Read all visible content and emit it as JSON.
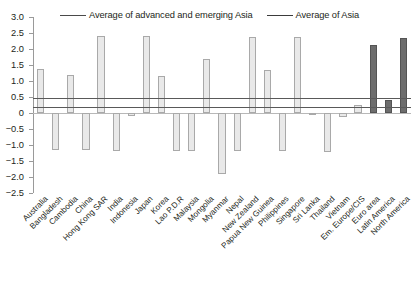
{
  "chart_data": {
    "type": "bar",
    "title": "",
    "xlabel": "",
    "ylabel": "",
    "ylim": [
      -2.5,
      3.0
    ],
    "ytick_step": 0.5,
    "yticks": [
      "3.0",
      "2.5",
      "2.0",
      "1.5",
      "1.0",
      "0.5",
      "0",
      "-0.5",
      "-1.0",
      "-1.5",
      "-2.0",
      "-2.5"
    ],
    "grid": false,
    "legend_position": "top",
    "categories": [
      "Australia",
      "Bangladesh",
      "Cambodia",
      "China",
      "Hong Kong SAR",
      "India",
      "Indonesia",
      "Japan",
      "Korea",
      "Lao P.D.R",
      "Malaysia",
      "Mongolia",
      "Myanmar",
      "Nepal",
      "New Zealand",
      "Papua New Guinea",
      "Philippines",
      "Singapore",
      "Sri Lanka",
      "Thailand",
      "Vietnam",
      "Em. Europe/CIS",
      "Euro area",
      "Latin America",
      "North America"
    ],
    "values": [
      1.37,
      -1.15,
      1.19,
      -1.17,
      2.41,
      -1.2,
      -0.1,
      2.4,
      1.17,
      -1.18,
      -1.18,
      1.68,
      -1.91,
      -1.18,
      2.39,
      1.33,
      -1.2,
      2.39,
      -0.04,
      -1.22,
      -0.13,
      0.25,
      2.13,
      0.4,
      2.35
    ],
    "bar_styles": [
      "light",
      "light",
      "light",
      "light",
      "light",
      "light",
      "light",
      "light",
      "light",
      "light",
      "light",
      "light",
      "light",
      "light",
      "light",
      "light",
      "light",
      "light",
      "light",
      "light",
      "light",
      "light",
      "dark",
      "dark",
      "dark"
    ],
    "reference_lines": [
      {
        "label": "Average of advanced and emerging Asia",
        "value": 0.47
      },
      {
        "label": "Average of Asia",
        "value": 0.2
      }
    ],
    "legend": [
      {
        "label": "Average of advanced and emerging Asia",
        "color": "#4a4a4a"
      },
      {
        "label": "Average of Asia",
        "color": "#3b3b3b"
      }
    ],
    "colors": {
      "light_bar_fill": "#e9e9e9",
      "light_bar_edge": "#a9a9a9",
      "dark_bar_fill": "#6d6d6d",
      "dark_bar_edge": "#545454",
      "axis": "#9a9a9a",
      "reference_line": "#595959",
      "text": "#231f20"
    }
  },
  "caption": ""
}
